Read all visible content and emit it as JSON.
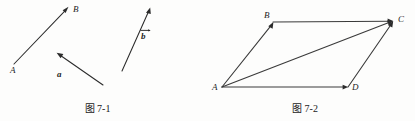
{
  "document": {
    "background_color": "#fdfdfc",
    "ink_color": "#2b2b2b"
  },
  "figures": [
    {
      "id": "figure-7-1",
      "caption": "图 7-1",
      "description": "Three free vectors drawn as arrows",
      "points": [
        {
          "label": "A",
          "x": 14,
          "y": 64
        },
        {
          "label": "B",
          "x": 71,
          "y": 8
        }
      ],
      "vectors": [
        {
          "name": "AB",
          "label": "",
          "from_x": 14,
          "from_y": 64,
          "to_x": 68,
          "to_y": 7
        },
        {
          "name": "a",
          "label": "a",
          "from_x": 103,
          "from_y": 85,
          "to_x": 57,
          "to_y": 53
        },
        {
          "name": "b",
          "label": "b",
          "from_x": 122,
          "from_y": 71,
          "to_x": 150,
          "to_y": 8
        }
      ],
      "labels": {
        "a_label": "a",
        "b_label": "b",
        "A_label": "A",
        "B_label": "B"
      }
    },
    {
      "id": "figure-7-2",
      "caption": "图 7-2",
      "description": "Parallelogram ABCD with diagonal AC, vector addition",
      "vertices": [
        {
          "label": "A",
          "x": 27,
          "y": 87
        },
        {
          "label": "B",
          "x": 78,
          "y": 22
        },
        {
          "label": "C",
          "x": 198,
          "y": 21
        },
        {
          "label": "D",
          "x": 153,
          "y": 87
        }
      ],
      "edges": [
        {
          "name": "AB",
          "from": "A",
          "to": "B",
          "arrow_at": "B"
        },
        {
          "name": "BC",
          "from": "B",
          "to": "C",
          "arrow_at": "C"
        },
        {
          "name": "AD",
          "from": "A",
          "to": "D",
          "arrow_at": "D"
        },
        {
          "name": "DC",
          "from": "D",
          "to": "C",
          "arrow_at": "C"
        },
        {
          "name": "AC",
          "from": "A",
          "to": "C",
          "arrow_at": "C"
        }
      ],
      "labels": {
        "A_label": "A",
        "B_label": "B",
        "C_label": "C",
        "D_label": "D"
      }
    }
  ]
}
